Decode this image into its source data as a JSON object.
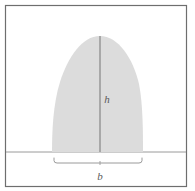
{
  "figure": {
    "kind": "geometry-diagram",
    "canvas": {
      "width": 195,
      "height": 191
    },
    "colors": {
      "background": "#ffffff",
      "frame_stroke": "#6e6e6e",
      "baseline_stroke": "#9a9a9a",
      "shape_fill": "#dcdcdc",
      "height_line_stroke": "#8c8c8c",
      "bracket_stroke": "#9a9a9a",
      "label_color": "#5a5a5a"
    },
    "frame": {
      "x": 5.5,
      "y": 5.5,
      "width": 181,
      "height": 181,
      "stroke_width": 1.2
    },
    "baseline": {
      "y": 152,
      "x_start": 6,
      "x_end": 186,
      "stroke_width": 1
    },
    "shape": {
      "name": "parabolic-dome",
      "base_left_x": 52,
      "base_right_x": 143,
      "base_y": 152,
      "apex_x": 100,
      "apex_y": 36,
      "path": "M 52 152 C 52 132 53 104 60 82 C 68 57 82 36 100 36 C 118 36 133 58 139 84 C 143 104 143 133 143 152 Z"
    },
    "height_line": {
      "x": 100,
      "y_top": 36,
      "y_bottom": 152,
      "stroke_width": 1.3
    },
    "bracket": {
      "y": 163,
      "x_left": 54,
      "x_right": 142,
      "tip_rise": 5,
      "center_x": 100,
      "center_tick_length": 4,
      "stroke_width": 1
    },
    "labels": {
      "height": {
        "text": "h",
        "x": 107,
        "y": 103
      },
      "base": {
        "text": "b",
        "x": 100,
        "y": 180
      }
    }
  }
}
